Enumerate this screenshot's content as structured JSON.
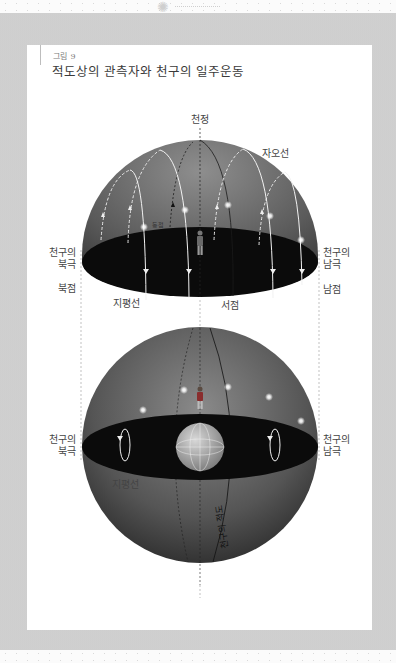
{
  "figure": {
    "number": "그림 9",
    "title": "적도상의 관측자와 천구의 일주운동"
  },
  "top_hemisphere": {
    "labels": {
      "zenith": "천정",
      "meridian": "자오선",
      "east_point": "동점",
      "north_celestial_pole": [
        "천구의",
        "북극"
      ],
      "south_celestial_pole": [
        "천구의",
        "남극"
      ],
      "north_point": "북점",
      "south_point": "남점",
      "horizon": "지평선",
      "west_point": "서점"
    }
  },
  "bottom_sphere": {
    "labels": {
      "north_celestial_pole": [
        "천구의",
        "북극"
      ],
      "south_celestial_pole": [
        "천구의",
        "남극"
      ],
      "horizon": "지평선",
      "celestial_equator": "천구의 적도"
    }
  },
  "colors": {
    "sphere_dark": "#2b2b2b",
    "sphere_light": "#8a8a8a",
    "horizon_plane": "#0a0a0a",
    "frame_gray": "#cccccc"
  }
}
